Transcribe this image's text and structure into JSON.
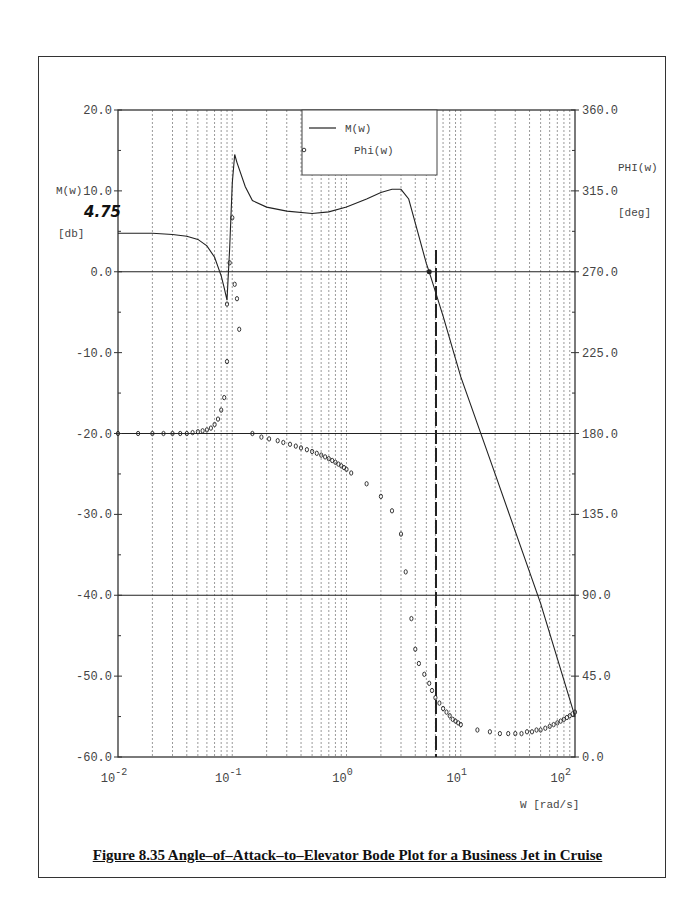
{
  "figure": {
    "caption": "Figure 8.35 Angle–of–Attack–to–Elevator Bode Plot for a Business Jet in Cruise"
  },
  "axes": {
    "left_label": "M(w)",
    "left_unit": "[db]",
    "right_label": "PHI(w)",
    "right_unit": "[deg]",
    "x_label": "W [rad/s]",
    "left_ticks": [
      "20.0",
      "10.0",
      "0.0",
      "-10.0",
      "-20.0",
      "-30.0",
      "-40.0",
      "-50.0",
      "-60.0"
    ],
    "right_ticks": [
      "360.0",
      "315.0",
      "270.0",
      "225.0",
      "180.0",
      "135.0",
      "90.0",
      "45.0",
      "0.0"
    ],
    "x_ticks": [
      {
        "base": "10",
        "exp": "-2"
      },
      {
        "base": "10",
        "exp": "-1"
      },
      {
        "base": "10",
        "exp": "0"
      },
      {
        "base": "10",
        "exp": "1"
      },
      {
        "base": "10",
        "exp": "2"
      }
    ]
  },
  "legend": {
    "line_label": "M(w)",
    "marker_label": "Phi(w)"
  },
  "annotation": {
    "text": "4.75"
  },
  "chart_data": {
    "type": "line",
    "xlabel": "W [rad/s]",
    "ylabel": "M(w) [db]",
    "y2label": "PHI(w) [deg]",
    "xscale": "log",
    "xlim": [
      0.01,
      100
    ],
    "ylim": [
      -60,
      20
    ],
    "y2lim": [
      0,
      360
    ],
    "grid": {
      "x": "dotted log minor+major",
      "y": "solid at 0, -20, -40 dB"
    },
    "legend_position": "top-center",
    "annotations": [
      {
        "text": "4.75",
        "at": "left axis, low-frequency magnitude asymptote"
      }
    ],
    "series": [
      {
        "name": "M(w)",
        "axis": "left",
        "style": "line",
        "x": [
          0.01,
          0.02,
          0.03,
          0.04,
          0.05,
          0.06,
          0.07,
          0.08,
          0.085,
          0.09,
          0.095,
          0.1,
          0.105,
          0.11,
          0.13,
          0.15,
          0.2,
          0.3,
          0.5,
          0.7,
          1.0,
          1.5,
          2.0,
          2.5,
          3.0,
          3.5,
          4.0,
          5.0,
          5.3,
          7.0,
          10.0,
          20.0,
          50.0,
          100.0
        ],
        "values": [
          4.75,
          4.75,
          4.6,
          4.4,
          4.0,
          3.2,
          1.8,
          -0.5,
          -2.0,
          -3.5,
          3.0,
          11.0,
          14.5,
          13.5,
          10.5,
          8.8,
          8.0,
          7.5,
          7.2,
          7.4,
          8.0,
          9.0,
          9.8,
          10.2,
          10.2,
          9.0,
          6.0,
          1.0,
          0.0,
          -5.5,
          -13.0,
          -25.0,
          -41.0,
          -55.0
        ]
      },
      {
        "name": "Phi(w)",
        "axis": "right",
        "style": "marker",
        "x": [
          0.01,
          0.015,
          0.02,
          0.025,
          0.03,
          0.035,
          0.04,
          0.045,
          0.05,
          0.055,
          0.06,
          0.065,
          0.07,
          0.075,
          0.08,
          0.085,
          0.09,
          0.09,
          0.095,
          0.1,
          0.105,
          0.11,
          0.115,
          0.15,
          0.18,
          0.21,
          0.25,
          0.28,
          0.32,
          0.36,
          0.4,
          0.45,
          0.5,
          0.55,
          0.6,
          0.65,
          0.7,
          0.75,
          0.8,
          0.85,
          0.9,
          0.95,
          1.0,
          1.1,
          1.5,
          2.0,
          2.5,
          3.0,
          3.3,
          3.7,
          4.0,
          4.3,
          4.8,
          5.3,
          5.6,
          6.0,
          6.5,
          7.0,
          7.5,
          8.0,
          8.5,
          9.0,
          9.5,
          10.0,
          14.0,
          18.0,
          22.0,
          26.0,
          30.0,
          34.0,
          38.0,
          42.0,
          46.0,
          50.0,
          55.0,
          60.0,
          65.0,
          70.0,
          75.0,
          80.0,
          85.0,
          90.0,
          95.0,
          100.0
        ],
        "values": [
          180,
          180,
          180,
          180,
          180,
          180,
          180,
          180.5,
          181,
          181.5,
          182,
          183,
          185,
          188,
          193,
          200,
          220,
          252,
          275,
          300,
          263,
          255,
          238,
          180,
          178,
          177,
          176,
          175,
          174,
          173,
          172,
          171,
          170,
          169,
          168,
          167,
          166,
          165,
          164,
          163,
          162,
          161,
          160,
          158,
          152,
          145,
          137,
          124,
          103,
          77,
          60,
          52,
          46,
          41,
          37,
          33,
          30,
          27,
          25,
          23,
          21,
          20,
          19,
          18,
          15,
          14,
          13,
          13,
          13,
          13,
          14,
          14,
          15,
          15,
          16,
          17,
          18,
          19,
          20,
          21,
          22,
          23,
          24,
          25
        ]
      }
    ]
  }
}
